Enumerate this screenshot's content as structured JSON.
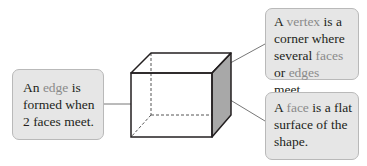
{
  "diagram": {
    "type": "labelled-cuboid",
    "callouts": {
      "edge": {
        "pre": "An ",
        "term": "edge",
        "post": " is formed when 2 faces meet."
      },
      "vertex": {
        "pre": "A ",
        "term": "vertex",
        "mid1": " is a corner where several ",
        "term2": "faces",
        "mid2": " or ",
        "term3": "edges",
        "post": " meet."
      },
      "face": {
        "pre": "A ",
        "term": "face",
        "post": " is a flat surface of the shape."
      }
    },
    "colors": {
      "callout_bg": "#e6e6e6",
      "callout_border": "#b9b9b9",
      "term_text": "#8a8a8a",
      "body_text": "#231f20",
      "shaded_face": "#a8a8a8",
      "edge_line": "#231f20"
    }
  }
}
